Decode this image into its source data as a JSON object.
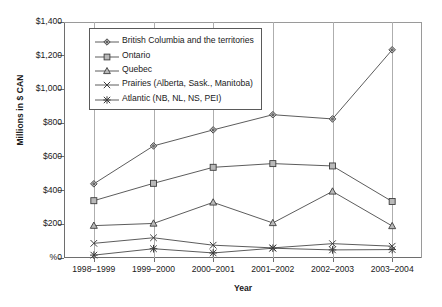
{
  "chart_data": {
    "type": "line",
    "title": "",
    "xlabel": "Year",
    "ylabel": "Millions in $ CAN",
    "categories": [
      "1998–1999",
      "1999–2000",
      "2000–2001",
      "2001–2002",
      "2002–2003",
      "2003–2004"
    ],
    "ylim": [
      0,
      1400
    ],
    "ytick_values": [
      0,
      200,
      400,
      600,
      800,
      1000,
      1200,
      1400
    ],
    "ytick_labels": [
      "%0",
      "$200",
      "$400",
      "$600",
      "$800",
      "$1,000",
      "$1,200",
      "$1,400"
    ],
    "grid": "vertical-only",
    "legend_position": "upper-left-inside",
    "series": [
      {
        "name": "British Columbia and the territories",
        "marker": "diamond",
        "values": [
          440,
          665,
          760,
          850,
          825,
          1235
        ]
      },
      {
        "name": "Ontario",
        "marker": "square",
        "values": [
          340,
          443,
          538,
          560,
          546,
          335
        ]
      },
      {
        "name": "Quebec",
        "marker": "triangle",
        "values": [
          192,
          205,
          330,
          208,
          395,
          190
        ]
      },
      {
        "name": "Prairies (Alberta, Sask., Manitoba)",
        "marker": "cross-x",
        "values": [
          87,
          120,
          76,
          60,
          85,
          70
        ]
      },
      {
        "name": "Atlantic (NB, NL, NS, PEI)",
        "marker": "asterisk",
        "values": [
          17,
          55,
          30,
          58,
          48,
          50
        ]
      }
    ]
  },
  "colors": {
    "line": "#4a4a4a",
    "marker_fill": "#b9b9b9",
    "marker_stroke": "#3d3d3d",
    "gridline": "#aeaeae",
    "axis": "#6e6e6e",
    "background": "#ffffff"
  }
}
